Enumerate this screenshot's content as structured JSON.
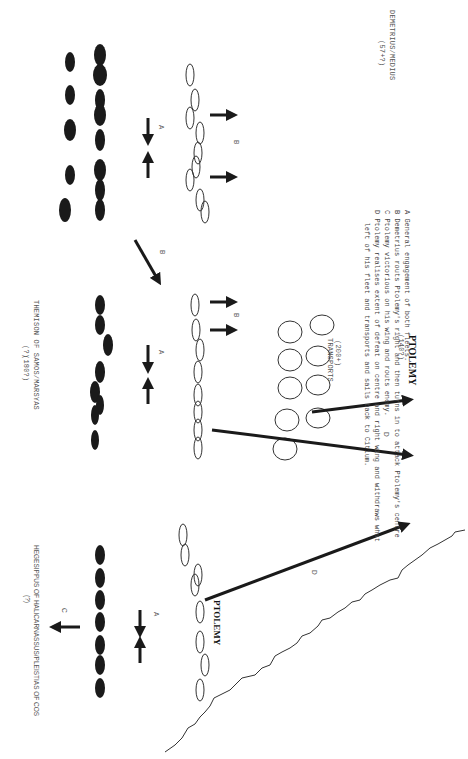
{
  "diagram": {
    "title_count": "(180?)",
    "squadrons": [
      {
        "name": "DEMETRIUS/MEDIUS",
        "count": "(57+?)"
      },
      {
        "name": "THEMISON OF SAMOS/MARSYAS",
        "count": "(?)"
      },
      {
        "name": "HEGESIPPUS OF HALICARNASSUS/PLEISTIAS OF COS",
        "count": "(?)"
      }
    ],
    "transports": {
      "count": "(200+)",
      "label": "TRANSPORTS"
    },
    "ptolemy_fleet": {
      "count": "(140?)",
      "label": "PTOLEMY"
    },
    "ptolemy_wing_label": "PTOLEMY",
    "arrow_labels": {
      "a": "A",
      "b": "B",
      "c": "C",
      "d": "D"
    },
    "legend": [
      "A General engagement of both fleets.",
      "B Demetrius routs Ptolemy's right and then turns in to attack Ptolemy's centre",
      "C Ptolemy victorious on his wing and routs enemy.",
      "D Ptolemy realises extent of defeat on centre and right wing and withdraws what",
      "   left of his fleet and transports and sails back to Citium."
    ],
    "colors": {
      "enemy_ship": "#1a1a1a",
      "ptolemy_ship_outline": "#333333",
      "arrow": "#1a1a1a",
      "coast": "#333333"
    }
  }
}
